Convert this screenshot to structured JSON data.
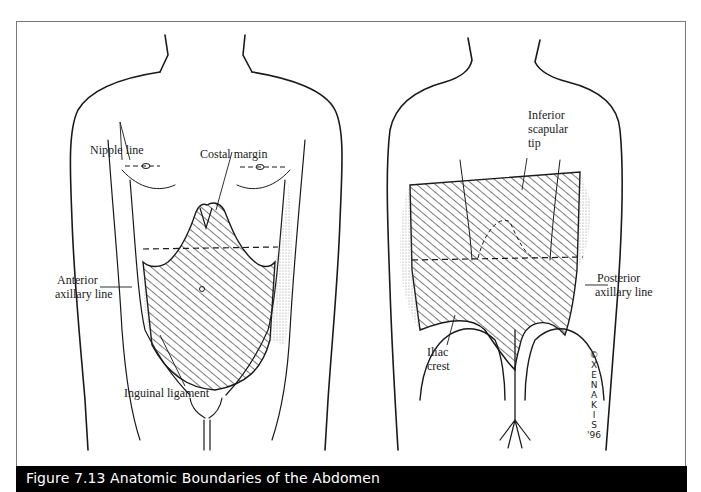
{
  "figure": {
    "caption": "Figure 7.13  Anatomic Boundaries of the Abdomen",
    "colors": {
      "caption_bg": "#000000",
      "caption_text": "#ffffff",
      "frame_border": "#7a7a7a",
      "ink": "#1a1a1a"
    }
  },
  "anterior_view": {
    "labels": {
      "nipple_line": "Nipple line",
      "costal_margin": "Costal margin",
      "anterior_axillary_line_1": "Anterior",
      "anterior_axillary_line_2": "axillary line",
      "inguinal_ligament": "Inguinal ligament"
    }
  },
  "posterior_view": {
    "labels": {
      "inferior_scapular_tip_1": "Inferior",
      "inferior_scapular_tip_2": "scapular",
      "inferior_scapular_tip_3": "tip",
      "posterior_axillary_line_1": "Posterior",
      "posterior_axillary_line_2": "axillary line",
      "iliac_crest_1": "Iliac",
      "iliac_crest_2": "crest"
    },
    "signature": {
      "copyright": "©",
      "artist": "XENAKIS",
      "year": "'96"
    }
  }
}
